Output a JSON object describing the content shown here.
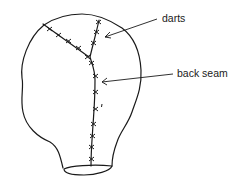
{
  "diagram": {
    "labels": {
      "darts": "darts",
      "back_seam": "back seam"
    },
    "colors": {
      "stroke": "#1a1a1a",
      "background": "#ffffff"
    }
  }
}
